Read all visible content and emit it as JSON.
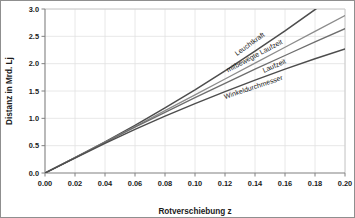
{
  "chart_data": {
    "type": "line",
    "title": "",
    "xlabel": "Rotverschiebung z",
    "ylabel": "Distanz in Mrd. Lj",
    "xlim": [
      0.0,
      0.2
    ],
    "ylim": [
      0.0,
      3.0
    ],
    "grid": true,
    "legend_position": "inline-curve-labels",
    "xticks": [
      "0.00",
      "0.02",
      "0.04",
      "0.06",
      "0.08",
      "0.10",
      "0.12",
      "0.14",
      "0.16",
      "0.18",
      "0.20"
    ],
    "xtick_values": [
      0.0,
      0.02,
      0.04,
      0.06,
      0.08,
      0.1,
      0.12,
      0.14,
      0.16,
      0.18,
      0.2
    ],
    "yticks": [
      "0.0",
      "0.5",
      "1.0",
      "1.5",
      "2.0",
      "2.5",
      "3.0"
    ],
    "ytick_values": [
      0.0,
      0.5,
      1.0,
      1.5,
      2.0,
      2.5,
      3.0
    ],
    "x": [
      0.0,
      0.02,
      0.04,
      0.06,
      0.08,
      0.1,
      0.12,
      0.14,
      0.16,
      0.18,
      0.2
    ],
    "series": [
      {
        "name": "Leuchtkraft",
        "label": "Leuchtkraft",
        "color": "#4d4d4d",
        "width": 1.5,
        "values": [
          0.0,
          0.28,
          0.57,
          0.87,
          1.19,
          1.52,
          1.87,
          2.23,
          2.6,
          2.99,
          3.39
        ],
        "label_x": 0.128,
        "label_y": 2.14
      },
      {
        "name": "mitbewegte Laufzeit",
        "label": "mitbewegte Laufzeit",
        "color": "#8c8c8c",
        "width": 1.3,
        "values": [
          0.0,
          0.28,
          0.56,
          0.85,
          1.14,
          1.43,
          1.72,
          2.01,
          2.3,
          2.59,
          2.88
        ],
        "label_x": 0.122,
        "label_y": 1.84
      },
      {
        "name": "Laufzeit",
        "label": "Laufzeit",
        "color": "#6e6e6e",
        "width": 1.3,
        "values": [
          0.0,
          0.28,
          0.56,
          0.84,
          1.11,
          1.38,
          1.64,
          1.9,
          2.15,
          2.4,
          2.64
        ],
        "label_x": 0.146,
        "label_y": 1.83
      },
      {
        "name": "Winkeldurchmesser",
        "label": "Winkeldurchmesser",
        "color": "#4d4d4d",
        "width": 1.4,
        "values": [
          0.0,
          0.27,
          0.54,
          0.8,
          1.04,
          1.27,
          1.49,
          1.7,
          1.9,
          2.09,
          2.27
        ],
        "label_x": 0.12,
        "label_y": 1.35
      }
    ]
  }
}
